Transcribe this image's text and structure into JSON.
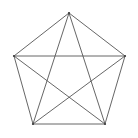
{
  "figure": {
    "width": 138,
    "height": 138,
    "background_color": "#ffffff",
    "stroke_color": "#555555",
    "vertex_color": "#444444",
    "stroke_width": 0.9,
    "vertex_radius": 1.1,
    "vertex_count": 5,
    "edge_count": 10,
    "outer_edge_count": 5,
    "diagonal_count": 5
  },
  "chart_data": {
    "type": "diagram",
    "xlabel": "",
    "ylabel": "",
    "xlim": [
      0,
      138
    ],
    "ylim": [
      0,
      138
    ],
    "grid": false,
    "legend": "none",
    "vertices": [
      {
        "id": "A",
        "label": "apex",
        "x": 69,
        "y": 13
      },
      {
        "id": "B",
        "label": "right",
        "x": 125,
        "y": 56
      },
      {
        "id": "C",
        "label": "bottom-right",
        "x": 105,
        "y": 124
      },
      {
        "id": "D",
        "label": "bottom-left",
        "x": 33,
        "y": 124
      },
      {
        "id": "E",
        "label": "left",
        "x": 14,
        "y": 56
      }
    ],
    "edges": [
      {
        "from": "A",
        "to": "B",
        "kind": "outer",
        "x1": 69,
        "y1": 13,
        "x2": 125,
        "y2": 56
      },
      {
        "from": "B",
        "to": "C",
        "kind": "outer",
        "x1": 125,
        "y1": 56,
        "x2": 105,
        "y2": 124
      },
      {
        "from": "C",
        "to": "D",
        "kind": "outer",
        "x1": 105,
        "y1": 124,
        "x2": 33,
        "y2": 124
      },
      {
        "from": "D",
        "to": "E",
        "kind": "outer",
        "x1": 33,
        "y1": 124,
        "x2": 14,
        "y2": 56
      },
      {
        "from": "E",
        "to": "A",
        "kind": "outer",
        "x1": 14,
        "y1": 56,
        "x2": 69,
        "y2": 13
      },
      {
        "from": "A",
        "to": "C",
        "kind": "diagonal",
        "x1": 69,
        "y1": 13,
        "x2": 105,
        "y2": 124
      },
      {
        "from": "A",
        "to": "D",
        "kind": "diagonal",
        "x1": 69,
        "y1": 13,
        "x2": 33,
        "y2": 124
      },
      {
        "from": "B",
        "to": "D",
        "kind": "diagonal",
        "x1": 125,
        "y1": 56,
        "x2": 33,
        "y2": 124
      },
      {
        "from": "B",
        "to": "E",
        "kind": "diagonal",
        "x1": 125,
        "y1": 56,
        "x2": 14,
        "y2": 56
      },
      {
        "from": "C",
        "to": "E",
        "kind": "diagonal",
        "x1": 105,
        "y1": 124,
        "x2": 14,
        "y2": 56
      }
    ],
    "annotations": []
  }
}
